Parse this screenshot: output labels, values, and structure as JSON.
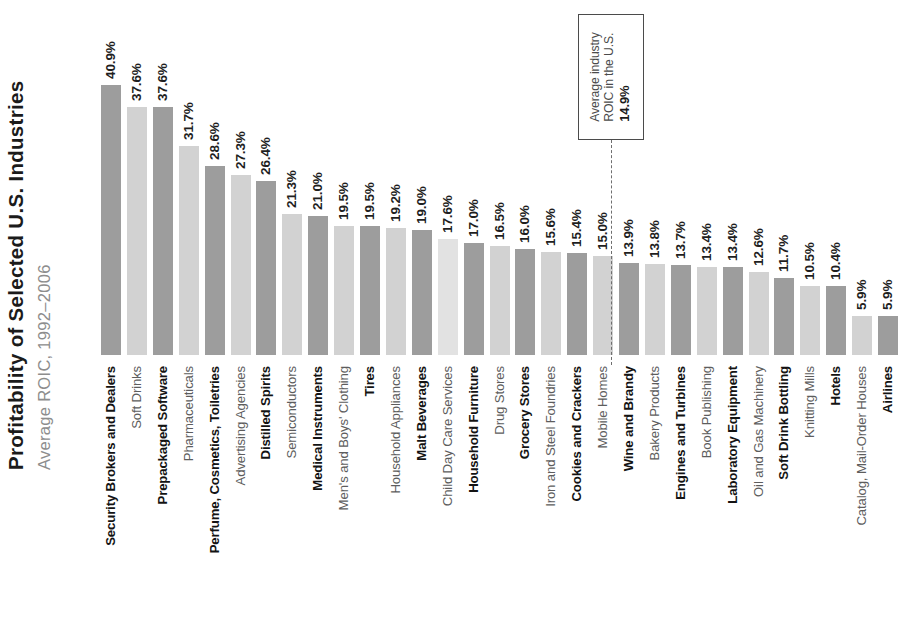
{
  "chart_data": {
    "type": "bar",
    "title": "Profitability of Selected U.S. Industries",
    "subtitle": "Average ROIC, 1992–2006",
    "xlabel": "",
    "ylabel": "",
    "ylim": [
      0,
      45
    ],
    "grid": false,
    "legend": null,
    "value_suffix": "%",
    "categories": [
      "Security Brokers and Dealers",
      "Soft Drinks",
      "Prepackaged Software",
      "Pharmaceuticals",
      "Perfume, Cosmetics, Toiletries",
      "Advertising Agencies",
      "Distilled Spirits",
      "Semiconductors",
      "Medical Instruments",
      "Men's and Boys' Clothing",
      "Tires",
      "Household Appliances",
      "Malt Beverages",
      "Child Day Care Services",
      "Household Furniture",
      "Drug Stores",
      "Grocery Stores",
      "Iron and Steel Foundries",
      "Cookies and Crackers",
      "Mobile Homes",
      "Wine and Brandy",
      "Bakery Products",
      "Engines and Turbines",
      "Book Publishing",
      "Laboratory Equipment",
      "Oil and Gas Machinery",
      "Soft Drink Bottling",
      "Knitting Mills",
      "Hotels",
      "Catalog, Mail-Order Houses",
      "Airlines"
    ],
    "values": [
      40.9,
      37.6,
      37.6,
      31.7,
      28.6,
      27.3,
      26.4,
      21.3,
      21.0,
      19.5,
      19.5,
      19.2,
      19.0,
      17.6,
      17.0,
      16.5,
      16.0,
      15.6,
      15.4,
      15.0,
      13.9,
      13.8,
      13.7,
      13.4,
      13.4,
      12.6,
      11.7,
      10.5,
      10.4,
      5.9,
      5.9
    ],
    "value_labels": [
      "40.9%",
      "37.6%",
      "37.6%",
      "31.7%",
      "28.6%",
      "27.3%",
      "26.4%",
      "21.3%",
      "21.0%",
      "19.5%",
      "19.5%",
      "19.2%",
      "19.0%",
      "17.6%",
      "17.0%",
      "16.5%",
      "16.0%",
      "15.6%",
      "15.4%",
      "15.0%",
      "13.9%",
      "13.8%",
      "13.7%",
      "13.4%",
      "13.4%",
      "12.6%",
      "11.7%",
      "10.5%",
      "10.4%",
      "5.9%",
      "5.9%"
    ],
    "bar_colors": [
      "#9d9d9d",
      "#d2d2d2",
      "#9d9d9d",
      "#d2d2d2",
      "#9d9d9d",
      "#d2d2d2",
      "#9d9d9d",
      "#d2d2d2",
      "#9d9d9d",
      "#d2d2d2",
      "#9d9d9d",
      "#d2d2d2",
      "#9d9d9d",
      "#e2e2e2",
      "#9d9d9d",
      "#d2d2d2",
      "#9d9d9d",
      "#d2d2d2",
      "#9d9d9d",
      "#d2d2d2",
      "#9d9d9d",
      "#d2d2d2",
      "#9d9d9d",
      "#d2d2d2",
      "#9d9d9d",
      "#d2d2d2",
      "#9d9d9d",
      "#d2d2d2",
      "#9d9d9d",
      "#d2d2d2",
      "#9d9d9d"
    ],
    "label_emphasis": [
      "bold",
      "plain",
      "bold",
      "plain",
      "bold",
      "plain",
      "bold",
      "plain",
      "bold",
      "plain",
      "bold",
      "plain",
      "bold",
      "plain",
      "bold",
      "plain",
      "bold",
      "plain",
      "bold",
      "plain",
      "bold",
      "plain",
      "bold",
      "plain",
      "bold",
      "plain",
      "bold",
      "plain",
      "bold",
      "plain",
      "bold"
    ],
    "annotation": {
      "line1": "Average industry",
      "line2": "ROIC in the U.S.",
      "value": "14.9%",
      "reference_value": 14.9,
      "after_category_index": 19
    }
  },
  "colors": {
    "bar_dark": "#9d9d9d",
    "bar_light": "#d2d2d2",
    "title": "#1b1b1b",
    "subtitle": "#8d8d8d",
    "annotation_border": "#4b4b4b",
    "reference_line": "#6e6e6e",
    "background": "#ffffff"
  }
}
